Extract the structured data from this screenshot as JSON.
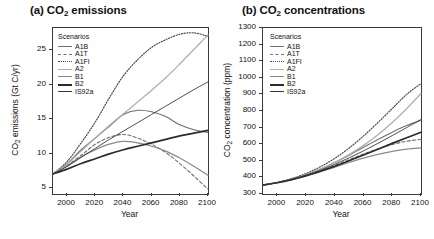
{
  "figure": {
    "panels": [
      {
        "id": "a",
        "title": "(a) CO",
        "title_sub": "2",
        "title_rest": " emissions",
        "legend_title": "Scenarios",
        "xlabel": "Year",
        "ylabel_pre": "CO",
        "ylabel_sub": "2",
        "ylabel_post": " emissions (Gt C/yr)"
      },
      {
        "id": "b",
        "title": "(b) CO",
        "title_sub": "2",
        "title_rest": " concentrations",
        "legend_title": "Scenarios",
        "xlabel": "Year",
        "ylabel_pre": "CO",
        "ylabel_sub": "2",
        "ylabel_post": " concentration (ppm)"
      }
    ]
  },
  "chart_data": [
    {
      "type": "line",
      "panel": "a",
      "title": "(a) CO2 emissions",
      "xlabel": "Year",
      "ylabel": "CO2 emissions (Gt C/yr)",
      "xlim": [
        1990,
        2100
      ],
      "ylim": [
        4.2,
        28.2
      ],
      "xticks": [
        2000,
        2020,
        2040,
        2060,
        2080,
        2100
      ],
      "yticks": [
        5,
        10,
        15,
        20,
        25
      ],
      "grid": false,
      "legend_position": "top-left-inside",
      "legend_title": "Scenarios",
      "x": [
        1990,
        2000,
        2010,
        2020,
        2030,
        2040,
        2050,
        2060,
        2070,
        2080,
        2090,
        2100
      ],
      "series": [
        {
          "name": "A1B",
          "style": "solid",
          "color": "#6f6f6f",
          "width": 1.1,
          "values": [
            7.1,
            8.6,
            10.6,
            12.3,
            14.0,
            15.7,
            16.3,
            16.1,
            15.4,
            14.2,
            13.5,
            13.1
          ]
        },
        {
          "name": "A1T",
          "style": "dashed",
          "color": "#6f6f6f",
          "width": 1.1,
          "values": [
            7.1,
            8.3,
            9.8,
            11.4,
            12.4,
            12.8,
            12.3,
            11.4,
            10.2,
            8.6,
            6.8,
            4.9
          ]
        },
        {
          "name": "A1FI",
          "style": "dotted",
          "color": "#4a4a4a",
          "width": 1.2,
          "values": [
            7.1,
            8.9,
            11.6,
            14.6,
            18.1,
            21.3,
            23.6,
            25.4,
            26.5,
            27.3,
            27.5,
            27.0
          ]
        },
        {
          "name": "A2",
          "style": "solid",
          "color": "#b0b0b0",
          "width": 1.3,
          "values": [
            7.1,
            8.5,
            10.4,
            12.3,
            14.1,
            15.8,
            17.5,
            19.2,
            21.0,
            23.0,
            25.1,
            27.2
          ]
        },
        {
          "name": "B1",
          "style": "solid",
          "color": "#8a8a8a",
          "width": 1.2,
          "values": [
            7.1,
            8.2,
            9.6,
            10.6,
            11.4,
            11.8,
            11.6,
            11.1,
            10.4,
            9.4,
            8.2,
            6.9
          ]
        },
        {
          "name": "B2",
          "style": "solid",
          "color": "#2b2b2b",
          "width": 1.7,
          "values": [
            7.1,
            7.8,
            8.6,
            9.3,
            10.0,
            10.6,
            11.1,
            11.6,
            12.1,
            12.6,
            13.0,
            13.4
          ]
        },
        {
          "name": "IS92a",
          "style": "solid",
          "color": "#3a3a3a",
          "width": 0.9,
          "values": [
            7.1,
            8.2,
            9.5,
            10.8,
            12.1,
            13.3,
            14.5,
            15.7,
            16.9,
            18.1,
            19.3,
            20.4
          ]
        }
      ]
    },
    {
      "type": "line",
      "panel": "b",
      "title": "(b) CO2 concentrations",
      "xlabel": "Year",
      "ylabel": "CO2 concentration (ppm)",
      "xlim": [
        1990,
        2100
      ],
      "ylim": [
        300,
        1300
      ],
      "xticks": [
        2000,
        2020,
        2040,
        2060,
        2080,
        2100
      ],
      "yticks": [
        300,
        400,
        500,
        600,
        700,
        800,
        900,
        1000,
        1100,
        1200,
        1300
      ],
      "grid": false,
      "legend_position": "top-left-inside",
      "legend_title": "Scenarios",
      "x": [
        1990,
        2000,
        2010,
        2020,
        2030,
        2040,
        2050,
        2060,
        2070,
        2080,
        2090,
        2100
      ],
      "series": [
        {
          "name": "A1B",
          "style": "solid",
          "color": "#6f6f6f",
          "width": 1.1,
          "values": [
            354,
            369,
            390,
            417,
            450,
            490,
            534,
            581,
            628,
            672,
            712,
            745
          ]
        },
        {
          "name": "A1T",
          "style": "dashed",
          "color": "#6f6f6f",
          "width": 1.1,
          "values": [
            354,
            368,
            387,
            411,
            440,
            473,
            507,
            541,
            572,
            598,
            618,
            629
          ]
        },
        {
          "name": "A1FI",
          "style": "dotted",
          "color": "#4a4a4a",
          "width": 1.2,
          "values": [
            354,
            370,
            393,
            424,
            464,
            515,
            577,
            650,
            730,
            815,
            900,
            965
          ]
        },
        {
          "name": "A2",
          "style": "solid",
          "color": "#b0b0b0",
          "width": 1.3,
          "values": [
            354,
            369,
            390,
            417,
            451,
            491,
            538,
            593,
            657,
            731,
            814,
            905
          ]
        },
        {
          "name": "B1",
          "style": "solid",
          "color": "#8a8a8a",
          "width": 1.2,
          "values": [
            354,
            368,
            386,
            408,
            434,
            462,
            490,
            516,
            539,
            557,
            570,
            578
          ]
        },
        {
          "name": "B2",
          "style": "solid",
          "color": "#2b2b2b",
          "width": 1.7,
          "values": [
            354,
            368,
            387,
            410,
            437,
            467,
            500,
            535,
            570,
            605,
            639,
            672
          ]
        },
        {
          "name": "IS92a",
          "style": "solid",
          "color": "#3a3a3a",
          "width": 0.9,
          "values": [
            354,
            369,
            389,
            414,
            444,
            479,
            518,
            560,
            605,
            652,
            700,
            748
          ]
        }
      ]
    }
  ]
}
